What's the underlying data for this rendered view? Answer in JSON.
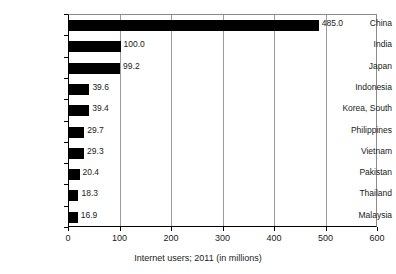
{
  "chart_data": {
    "type": "bar",
    "orientation": "horizontal",
    "title": "",
    "xlabel": "Internet users; 2011 (in millions)",
    "ylabel": "",
    "categories": [
      "China",
      "India",
      "Japan",
      "Indonesia",
      "Korea, South",
      "Philippines",
      "Vietnam",
      "Pakistan",
      "Thailand",
      "Malaysia"
    ],
    "values": [
      485.0,
      100.0,
      99.2,
      39.6,
      39.4,
      29.7,
      29.3,
      20.4,
      18.3,
      16.9
    ],
    "value_labels": [
      "485.0",
      "100.0",
      "99.2",
      "39.6",
      "39.4",
      "29.7",
      "29.3",
      "20.4",
      "18.3",
      "16.9"
    ],
    "xlim": [
      0,
      600
    ],
    "xticks": [
      0,
      100,
      200,
      300,
      400,
      500,
      600
    ],
    "xtick_labels": [
      "0",
      "100",
      "200",
      "300",
      "400",
      "500",
      "600"
    ],
    "grid": true,
    "grid_axis": "x",
    "legend": false,
    "bar_color": "#000000",
    "grid_color": "#9b9b9b",
    "axis_color": "#000000",
    "background": "#ffffff"
  }
}
